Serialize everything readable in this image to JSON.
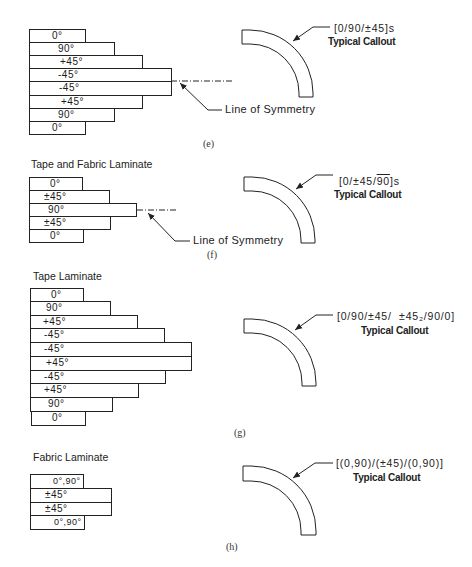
{
  "figure": {
    "sections": [
      {
        "id": "e",
        "label": "(e)",
        "title": "",
        "plies": [
          {
            "label": "0°",
            "width": 57
          },
          {
            "label": "90°",
            "width": 86
          },
          {
            "label": "+45°",
            "width": 113
          },
          {
            "label": "-45°",
            "width": 142
          },
          {
            "label": "-45°",
            "width": 142
          },
          {
            "label": "+45°",
            "width": 113
          },
          {
            "label": "90°",
            "width": 85
          },
          {
            "label": "0°",
            "width": 57
          }
        ],
        "symmetry_label": "Line of Symmetry",
        "callout": "[0/90/±45]s",
        "callout_caption": "Typical Callout"
      },
      {
        "id": "f",
        "label": "(f)",
        "title": "Tape and Fabric Laminate",
        "plies": [
          {
            "label": "0°",
            "width": 54
          },
          {
            "label": "±45°",
            "width": 81
          },
          {
            "label": "90°",
            "width": 108
          },
          {
            "label": "±45°",
            "width": 82
          },
          {
            "label": "0°",
            "width": 55
          }
        ],
        "symmetry_label": "Line of Symmetry",
        "callout_prefix": "[0/±45/",
        "callout_overlined": "90",
        "callout_suffix": "]s",
        "callout_caption": "Typical Callout"
      },
      {
        "id": "g",
        "label": "(g)",
        "title": "Tape Laminate",
        "plies": [
          {
            "label": "0°",
            "width": 54
          },
          {
            "label": "90°",
            "width": 81
          },
          {
            "label": "+45°",
            "width": 108
          },
          {
            "label": "-45°",
            "width": 135
          },
          {
            "label": "-45°",
            "width": 162
          },
          {
            "label": "+45°",
            "width": 162
          },
          {
            "label": "-45°",
            "width": 136
          },
          {
            "label": "+45°",
            "width": 109
          },
          {
            "label": "90°",
            "width": 83
          },
          {
            "label": "0°",
            "width": 55
          }
        ],
        "callout": "[0/90/±45/  ±45₂/90/0]",
        "callout_caption": "Typical Callout"
      },
      {
        "id": "h",
        "label": "(h)",
        "title": "Fabric Laminate",
        "plies": [
          {
            "label": "0°,90°",
            "width": 54
          },
          {
            "label": "±45°",
            "width": 82
          },
          {
            "label": "±45°",
            "width": 82
          },
          {
            "label": "0°,90°",
            "width": 55
          }
        ],
        "callout": "[(0,90)/(±45)/(0,90)]",
        "callout_caption": "Typical Callout"
      }
    ]
  }
}
